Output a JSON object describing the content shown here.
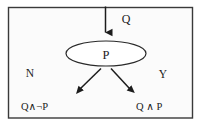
{
  "diagram": {
    "frame": {
      "border_color": "#3a3a3a",
      "background_color": "#fbfbfb"
    },
    "ink_color": "#1c1c1c",
    "input": {
      "label": "Q",
      "arrow_name": "input-arrow-down"
    },
    "node": {
      "label": "P",
      "shape": "ellipse"
    },
    "branches": [
      {
        "label": "N",
        "side": "left",
        "outcome": "Q∧¬P",
        "arrow_name": "branch-arrow-no"
      },
      {
        "label": "Y",
        "side": "right",
        "outcome": "Q ∧ P",
        "arrow_name": "branch-arrow-yes"
      }
    ]
  }
}
